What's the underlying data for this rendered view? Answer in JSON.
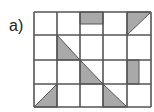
{
  "label": "a)",
  "grid": {
    "cols": 5,
    "rows": 4,
    "x": [
      34,
      57,
      80,
      103,
      127,
      151
    ],
    "y": [
      12,
      35,
      60,
      84,
      107
    ],
    "line_color": "#555555",
    "fill_color": "#a9a9a9"
  },
  "shaded_shapes": [
    {
      "cell": [
        0,
        2
      ],
      "shape": "rectangle",
      "desc": "top strip"
    },
    {
      "cell": [
        0,
        4
      ],
      "shape": "triangle",
      "desc": "upper-left half"
    },
    {
      "cell": [
        1,
        1
      ],
      "shape": "triangle",
      "desc": "lower-left half"
    },
    {
      "cell": [
        2,
        2
      ],
      "shape": "triangle",
      "desc": "lower-left half"
    },
    {
      "cell": [
        2,
        4
      ],
      "shape": "rectangle",
      "desc": "left vertical strip"
    },
    {
      "cell": [
        3,
        0
      ],
      "shape": "triangle",
      "desc": "lower-right half"
    },
    {
      "cell": [
        3,
        3
      ],
      "shape": "triangle",
      "desc": "lower-left half"
    }
  ]
}
